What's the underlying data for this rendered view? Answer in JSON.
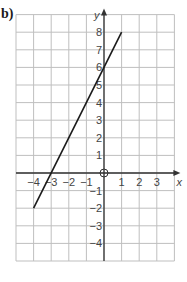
{
  "part_label": "b)",
  "chart_data": {
    "type": "line",
    "title": "",
    "xlabel": "x",
    "ylabel": "y",
    "xlim": [
      -5,
      4
    ],
    "ylim": [
      -5,
      9
    ],
    "grid": true,
    "x_ticks": [
      -4,
      -3,
      -2,
      -1,
      1,
      2,
      3
    ],
    "y_ticks": [
      -4,
      -3,
      -2,
      -1,
      1,
      2,
      3,
      4,
      5,
      6,
      7,
      8
    ],
    "origin_label": "O",
    "series": [
      {
        "name": "y = 2x + 6",
        "x": [
          -4,
          1
        ],
        "y": [
          -2,
          8
        ]
      }
    ]
  },
  "colors": {
    "grid": "#bfbfbf",
    "axis": "#333333",
    "line": "#1a1a1a",
    "text": "#444444"
  }
}
